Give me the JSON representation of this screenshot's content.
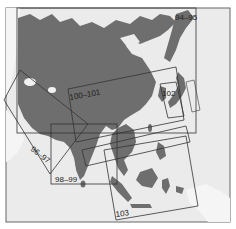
{
  "map": {
    "title": "Asia atlas page index",
    "colors": {
      "background": "#ececec",
      "sea": "#e9e9e9",
      "land_focus": "#6f6f6f",
      "land_other": "#f4f4f4",
      "frame": "#555555",
      "box": "#333333",
      "label": "#222222"
    },
    "page_boxes": [
      {
        "id": "94-95",
        "label": "94–95"
      },
      {
        "id": "96-97",
        "label": "96–97"
      },
      {
        "id": "98-99",
        "label": "98–99"
      },
      {
        "id": "100-101",
        "label": "100–101"
      },
      {
        "id": "102",
        "label": "102"
      },
      {
        "id": "103",
        "label": "103"
      }
    ]
  }
}
